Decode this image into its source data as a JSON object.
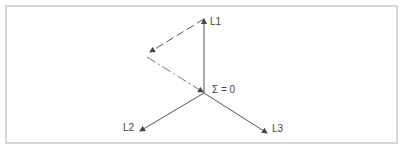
{
  "diagram": {
    "type": "phasor",
    "labels": {
      "l1": "L1",
      "l2": "L2",
      "l3": "L3",
      "sum": "Σ = 0"
    },
    "colors": {
      "line": "#555555",
      "frame": "#d6d6d6",
      "text": "#444444"
    }
  }
}
